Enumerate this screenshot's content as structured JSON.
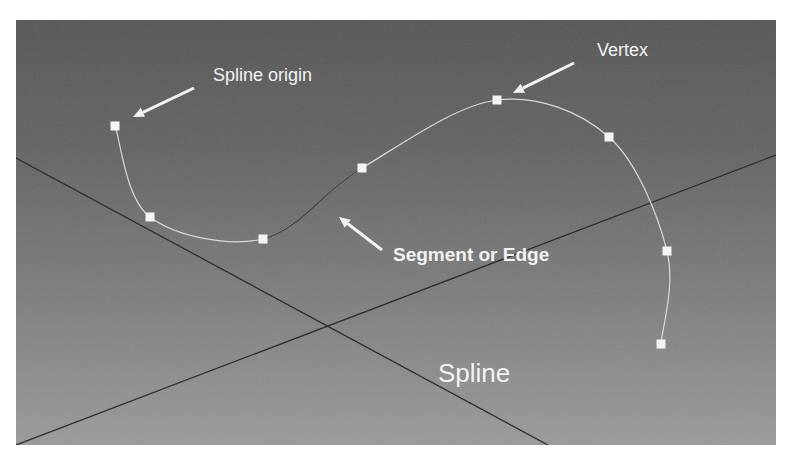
{
  "diagram": {
    "title": "Spline",
    "labels": {
      "spline_origin": "Spline origin",
      "vertex": "Vertex",
      "segment": "Segment or Edge",
      "spline": "Spline"
    },
    "colors": {
      "background_top": "#565656",
      "background_bottom": "#9a9a9a",
      "spline_stroke": "#d8d8d8",
      "selected_segment_stroke": "#3c3c3c",
      "vertex_fill": "#f4f4f4",
      "grid_axis_stroke": "#2e2e2e",
      "arrow_color": "#f2f2f2",
      "label_color": "#f2f2f2"
    },
    "vertices": [
      {
        "x": 115,
        "y": 126
      },
      {
        "x": 150,
        "y": 217
      },
      {
        "x": 263,
        "y": 239
      },
      {
        "x": 362,
        "y": 168
      },
      {
        "x": 497,
        "y": 100
      },
      {
        "x": 609,
        "y": 137
      },
      {
        "x": 667,
        "y": 251
      },
      {
        "x": 661,
        "y": 344
      }
    ],
    "selected_segment": [
      2,
      3
    ],
    "grid_axes": [
      {
        "x1": 16,
        "y1": 158,
        "x2": 548,
        "y2": 445
      },
      {
        "x1": 16,
        "y1": 445,
        "x2": 776,
        "y2": 155
      }
    ],
    "arrows": [
      {
        "name": "spline-origin-arrow",
        "from": [
          194,
          88
        ],
        "to": [
          133,
          117
        ]
      },
      {
        "name": "vertex-arrow",
        "from": [
          574,
          63
        ],
        "to": [
          513,
          93
        ]
      },
      {
        "name": "segment-arrow",
        "from": [
          382,
          250
        ],
        "to": [
          339,
          217
        ]
      }
    ]
  }
}
